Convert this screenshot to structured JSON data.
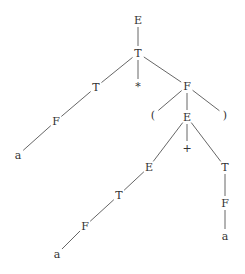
{
  "diagram": {
    "type": "parse-tree",
    "width": 245,
    "height": 274,
    "colors": {
      "text": "#333333",
      "edge": "#555555",
      "background": "#ffffff"
    },
    "nodes": [
      {
        "id": "n0",
        "label": "E",
        "x": 138,
        "y": 20
      },
      {
        "id": "n1",
        "label": "T",
        "x": 138,
        "y": 53
      },
      {
        "id": "n2",
        "label": "T",
        "x": 96,
        "y": 87
      },
      {
        "id": "n3",
        "label": "*",
        "x": 138,
        "y": 86
      },
      {
        "id": "n4",
        "label": "F",
        "x": 187,
        "y": 86
      },
      {
        "id": "n5",
        "label": "F",
        "x": 56,
        "y": 121
      },
      {
        "id": "n6",
        "label": "a",
        "x": 18,
        "y": 155
      },
      {
        "id": "n7",
        "label": "(",
        "x": 153,
        "y": 115
      },
      {
        "id": "n8",
        "label": "E",
        "x": 187,
        "y": 117
      },
      {
        "id": "n9",
        "label": ")",
        "x": 225,
        "y": 115
      },
      {
        "id": "n10",
        "label": "E",
        "x": 149,
        "y": 167
      },
      {
        "id": "n11",
        "label": "+",
        "x": 187,
        "y": 148
      },
      {
        "id": "n12",
        "label": "T",
        "x": 225,
        "y": 167
      },
      {
        "id": "n13",
        "label": "T",
        "x": 119,
        "y": 195
      },
      {
        "id": "n14",
        "label": "F",
        "x": 225,
        "y": 203
      },
      {
        "id": "n15",
        "label": "F",
        "x": 85,
        "y": 226
      },
      {
        "id": "n16",
        "label": "a",
        "x": 225,
        "y": 236
      },
      {
        "id": "n17",
        "label": "a",
        "x": 57,
        "y": 254
      }
    ],
    "edges": [
      [
        "n0",
        "n1"
      ],
      [
        "n1",
        "n2"
      ],
      [
        "n1",
        "n3"
      ],
      [
        "n1",
        "n4"
      ],
      [
        "n2",
        "n5"
      ],
      [
        "n5",
        "n6"
      ],
      [
        "n4",
        "n7"
      ],
      [
        "n4",
        "n8"
      ],
      [
        "n4",
        "n9"
      ],
      [
        "n8",
        "n10"
      ],
      [
        "n8",
        "n11"
      ],
      [
        "n8",
        "n12"
      ],
      [
        "n10",
        "n13"
      ],
      [
        "n13",
        "n15"
      ],
      [
        "n15",
        "n17"
      ],
      [
        "n12",
        "n14"
      ],
      [
        "n14",
        "n16"
      ]
    ]
  }
}
